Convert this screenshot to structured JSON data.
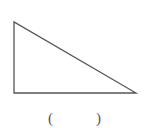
{
  "figure": {
    "shape": "right-triangle",
    "vertices": [
      [
        14,
        22
      ],
      [
        14,
        93
      ],
      [
        136,
        93
      ]
    ],
    "stroke_color": "#555555"
  },
  "answer_blank": {
    "left_paren": "(",
    "right_paren": ")"
  }
}
